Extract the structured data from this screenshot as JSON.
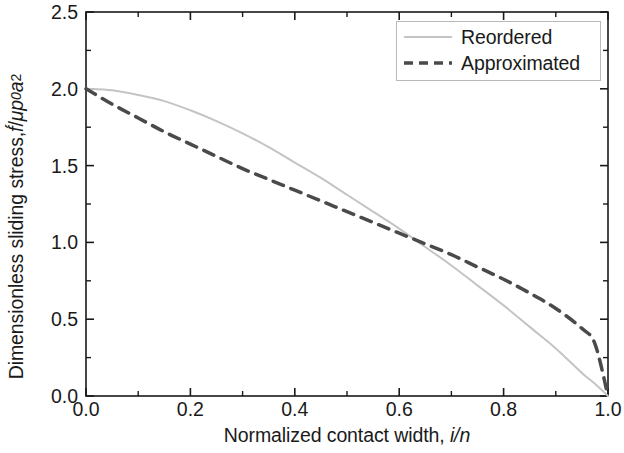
{
  "chart_data": {
    "type": "line",
    "title": "",
    "xlabel": "Normalized contact width, i/n",
    "ylabel": "Dimensionless sliding stress, f́/μp0a2",
    "xlim": [
      0.0,
      1.0
    ],
    "ylim": [
      0.0,
      2.5
    ],
    "xticks": [
      "0.0",
      "0.2",
      "0.4",
      "0.6",
      "0.8",
      "1.0"
    ],
    "xtick_values": [
      0.0,
      0.2,
      0.4,
      0.6,
      0.8,
      1.0
    ],
    "yticks": [
      "0.0",
      "0.5",
      "1.0",
      "1.5",
      "2.0",
      "2.5"
    ],
    "ytick_values": [
      0.0,
      0.5,
      1.0,
      1.5,
      2.0,
      2.5
    ],
    "x_minor_step": 0.1,
    "y_minor_step": 0.25,
    "grid": false,
    "legend_position": "top-right",
    "x": [
      0.0,
      0.05,
      0.1,
      0.15,
      0.2,
      0.25,
      0.3,
      0.35,
      0.4,
      0.45,
      0.5,
      0.55,
      0.6,
      0.65,
      0.7,
      0.75,
      0.8,
      0.85,
      0.9,
      0.95,
      0.975,
      1.0
    ],
    "series": [
      {
        "name": "Reordered",
        "style": "solid",
        "color": "#c4c4c4",
        "width": 2,
        "values": [
          2.0,
          1.99,
          1.96,
          1.92,
          1.86,
          1.79,
          1.71,
          1.62,
          1.52,
          1.42,
          1.31,
          1.2,
          1.09,
          0.97,
          0.85,
          0.72,
          0.59,
          0.45,
          0.31,
          0.15,
          0.08,
          0.0
        ]
      },
      {
        "name": "Approximated",
        "style": "dashed",
        "color": "#4a4a4a",
        "width": 3.5,
        "dash": "11,8",
        "values": [
          2.0,
          1.9,
          1.81,
          1.72,
          1.64,
          1.56,
          1.48,
          1.41,
          1.34,
          1.27,
          1.2,
          1.13,
          1.06,
          0.99,
          0.92,
          0.84,
          0.76,
          0.67,
          0.57,
          0.44,
          0.34,
          0.0
        ]
      }
    ],
    "crossover": {
      "x": 0.48,
      "y": 1.24
    }
  },
  "axes": {
    "y_label_parts": {
      "main": "Dimensionless sliding stress, ",
      "f": "f́",
      "slash": "/",
      "mu": "μ",
      "p": "p",
      "p_sub": "0",
      "a": "a",
      "a_sup": "2"
    },
    "x_label_parts": {
      "main": "Normalized contact width, ",
      "i": "i",
      "slash": "/",
      "n": "n"
    }
  },
  "legend": {
    "entries": [
      {
        "label": "Reordered",
        "sample": "solid-line-sample"
      },
      {
        "label": "Approximated",
        "sample": "dashed-line-sample"
      }
    ]
  },
  "colors": {
    "axis": "#1a1a1a",
    "reordered": "#c4c4c4",
    "approximated": "#4a4a4a",
    "legend_border": "#b9b9b9",
    "background": "#ffffff"
  }
}
